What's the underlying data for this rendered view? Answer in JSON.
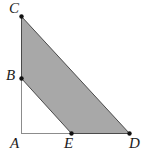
{
  "figure": {
    "canvas": {
      "width": 145,
      "height": 155,
      "background": "#ffffff"
    },
    "style": {
      "shaded_fill": "#a8a8a8",
      "shaded_stroke": "#4a4a4a",
      "axis_line_color": "#8c8c8c",
      "vertex_dot_color": "#111111",
      "label_color": "#1c1c1c",
      "shaded_stroke_width": 1,
      "axis_line_width": 1,
      "vertex_dot_radius": 2.2
    },
    "points": [
      {
        "id": "A",
        "label": "A",
        "x": 21,
        "y": 133,
        "dot": false,
        "label_x": 10,
        "label_y": 136
      },
      {
        "id": "B",
        "label": "B",
        "x": 21,
        "y": 78,
        "dot": true,
        "label_x": 6,
        "label_y": 68
      },
      {
        "id": "C",
        "label": "C",
        "x": 21,
        "y": 16,
        "dot": true,
        "label_x": 9,
        "label_y": 1
      },
      {
        "id": "D",
        "label": "D",
        "x": 129,
        "y": 133,
        "dot": true,
        "label_x": 129,
        "label_y": 136
      },
      {
        "id": "E",
        "label": "E",
        "x": 71,
        "y": 133,
        "dot": true,
        "label_x": 64,
        "label_y": 136
      }
    ],
    "lines": [
      {
        "id": "AC",
        "from": "A",
        "to": "C",
        "description": "vertical leg"
      },
      {
        "id": "AD",
        "from": "A",
        "to": "D",
        "description": "horizontal leg"
      }
    ],
    "shaded_region": {
      "id": "BCDE",
      "vertices": [
        "B",
        "C",
        "D",
        "E"
      ],
      "fill": "#a8a8a8"
    }
  },
  "chart_data": {
    "type": "scatter",
    "xlabel": "",
    "ylabel": "",
    "x": [
      21,
      21,
      21,
      129,
      71
    ],
    "y": [
      133,
      78,
      16,
      133,
      133
    ],
    "point_labels": [
      "A",
      "B",
      "C",
      "D",
      "E"
    ],
    "xlim": [
      0,
      145
    ],
    "ylim": [
      0,
      155
    ],
    "grid": false,
    "legend": "none",
    "annotations": [
      "Segment AC is vertical from A(21,133) to C(21,16)",
      "Segment AD is horizontal from A(21,133) to D(129,133)",
      "B lies on AC; E lies on AD",
      "Quadrilateral BCDE is shaded gray"
    ]
  }
}
